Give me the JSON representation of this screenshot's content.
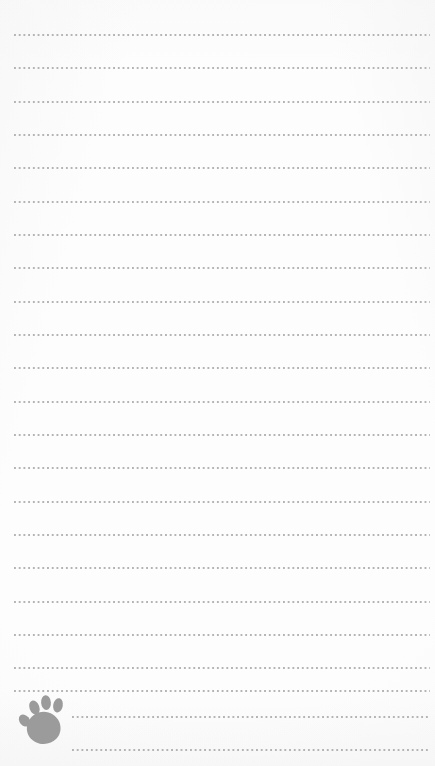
{
  "page": {
    "kind": "ruled-notepad-page",
    "width": 435,
    "height": 766,
    "background_color": "#fdfdfd",
    "paper_tint_color": "#f4f4f4"
  },
  "ruling": {
    "style": "dotted",
    "dot_color": "#b4b4b4",
    "dot_size_px": 1.7,
    "dot_pitch_px": 4.72,
    "line_count": 23,
    "first_line_y": 34,
    "line_spacing_px": 33.3,
    "left_margin_x": 14,
    "right_edge_x": 430,
    "indented_left_margin_x": 72,
    "lines": [
      {
        "y": 34,
        "left": 14,
        "right": 430,
        "indented": false
      },
      {
        "y": 67,
        "left": 14,
        "right": 430,
        "indented": false
      },
      {
        "y": 101,
        "left": 14,
        "right": 430,
        "indented": false
      },
      {
        "y": 134,
        "left": 14,
        "right": 430,
        "indented": false
      },
      {
        "y": 167,
        "left": 14,
        "right": 430,
        "indented": false
      },
      {
        "y": 201,
        "left": 14,
        "right": 430,
        "indented": false
      },
      {
        "y": 234,
        "left": 14,
        "right": 430,
        "indented": false
      },
      {
        "y": 267,
        "left": 14,
        "right": 430,
        "indented": false
      },
      {
        "y": 301,
        "left": 14,
        "right": 430,
        "indented": false
      },
      {
        "y": 334,
        "left": 14,
        "right": 430,
        "indented": false
      },
      {
        "y": 367,
        "left": 14,
        "right": 430,
        "indented": false
      },
      {
        "y": 401,
        "left": 14,
        "right": 430,
        "indented": false
      },
      {
        "y": 434,
        "left": 14,
        "right": 430,
        "indented": false
      },
      {
        "y": 467,
        "left": 14,
        "right": 430,
        "indented": false
      },
      {
        "y": 501,
        "left": 14,
        "right": 430,
        "indented": false
      },
      {
        "y": 534,
        "left": 14,
        "right": 430,
        "indented": false
      },
      {
        "y": 567,
        "left": 14,
        "right": 430,
        "indented": false
      },
      {
        "y": 601,
        "left": 14,
        "right": 430,
        "indented": false
      },
      {
        "y": 634,
        "left": 14,
        "right": 430,
        "indented": false
      },
      {
        "y": 667,
        "left": 14,
        "right": 430,
        "indented": false
      },
      {
        "y": 690,
        "left": 14,
        "right": 430,
        "indented": false
      },
      {
        "y": 716,
        "left": 72,
        "right": 430,
        "indented": true
      },
      {
        "y": 749,
        "left": 72,
        "right": 430,
        "indented": true
      }
    ]
  },
  "decoration": {
    "paw_print": {
      "label": "paw-print",
      "color": "#9b9b9b",
      "x": 16,
      "y": 692,
      "width": 54,
      "height": 56,
      "toe_count": 4
    }
  }
}
